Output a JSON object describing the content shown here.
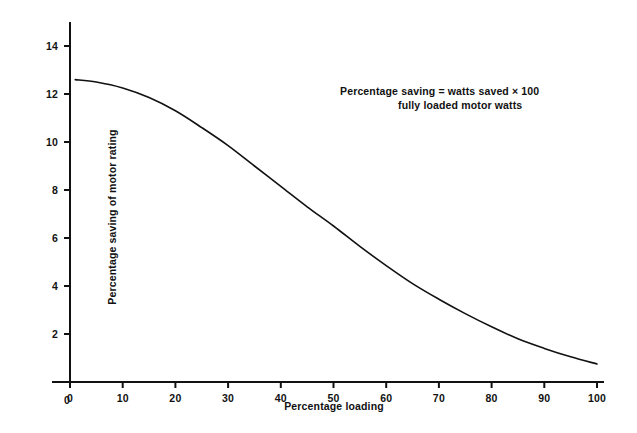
{
  "chart_data": {
    "type": "line",
    "title": "",
    "subtitle": "",
    "xlabel": "Percentage loading",
    "ylabel": "Percentage saving of motor rating",
    "xlim": [
      0,
      100
    ],
    "ylim": [
      0,
      14
    ],
    "grid": false,
    "legend": null,
    "xticks": [
      "0",
      "10",
      "20",
      "30",
      "40",
      "50",
      "60",
      "70",
      "80",
      "90",
      "100"
    ],
    "yticks": [
      "0",
      "2",
      "4",
      "6",
      "8",
      "10",
      "12",
      "14"
    ],
    "annotations": [
      {
        "name": "formula",
        "numerator_line": "Percentage saving = watts saved  ×  100",
        "denominator_line": "fully loaded motor watts"
      }
    ],
    "series": [
      {
        "name": "Percentage saving of motor rating",
        "color": "#111111",
        "x": [
          1,
          5,
          10,
          15,
          20,
          25,
          30,
          35,
          40,
          45,
          50,
          55,
          60,
          65,
          70,
          75,
          80,
          85,
          90,
          95,
          100
        ],
        "values": [
          12.6,
          12.5,
          12.25,
          11.85,
          11.3,
          10.6,
          9.85,
          9.0,
          8.15,
          7.3,
          6.5,
          5.65,
          4.85,
          4.1,
          3.45,
          2.85,
          2.3,
          1.8,
          1.4,
          1.05,
          0.75
        ]
      }
    ]
  },
  "axis_geometry": {
    "x0_px": 70,
    "x100_px": 597,
    "y0_px": 382,
    "y14_px": 46
  }
}
